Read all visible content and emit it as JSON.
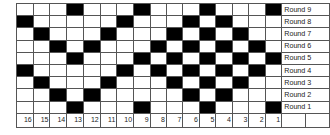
{
  "diagram": {
    "type": "knitting/weaving round chart",
    "column_numbers": [
      16,
      15,
      14,
      13,
      12,
      11,
      10,
      9,
      8,
      7,
      6,
      5,
      4,
      3,
      2,
      1
    ],
    "colors": {
      "filled": "#000000",
      "empty": "#ffffff",
      "grid": "#555555"
    },
    "rounds": [
      {
        "label": "Round 9",
        "filled": [
          13,
          9,
          5,
          1
        ]
      },
      {
        "label": "Round 8",
        "filled": [
          16,
          10,
          6,
          4
        ]
      },
      {
        "label": "Round 7",
        "filled": [
          15,
          11,
          7,
          5,
          3
        ]
      },
      {
        "label": "Round 6",
        "filled": [
          14,
          12,
          8,
          6,
          4,
          2
        ]
      },
      {
        "label": "Round 5",
        "filled": [
          13,
          9,
          7,
          5,
          3,
          1
        ]
      },
      {
        "label": "Round 4",
        "filled": [
          16,
          10,
          8,
          6,
          4,
          2
        ]
      },
      {
        "label": "Round 3",
        "filled": [
          15,
          11,
          7,
          5,
          3
        ]
      },
      {
        "label": "Round 2",
        "filled": [
          14,
          12,
          6,
          4
        ]
      },
      {
        "label": "Round 1",
        "filled": [
          13,
          9,
          5,
          1
        ]
      }
    ]
  }
}
